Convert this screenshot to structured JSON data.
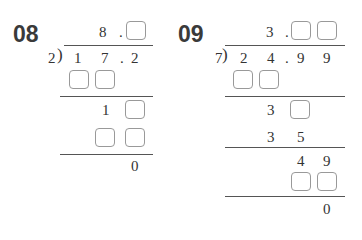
{
  "problems": [
    {
      "number": "08",
      "divisor": "2",
      "dividend": [
        "1",
        "7",
        ".",
        "2"
      ],
      "quotient": [
        "8",
        "."
      ],
      "steps": [
        "1",
        "0"
      ]
    },
    {
      "number": "09",
      "divisor": "7",
      "dividend": [
        "2",
        "4",
        ".",
        "9",
        "9"
      ],
      "quotient": [
        "3",
        "."
      ],
      "steps": [
        "3",
        "3",
        "5",
        "4",
        "9",
        "0"
      ]
    }
  ]
}
